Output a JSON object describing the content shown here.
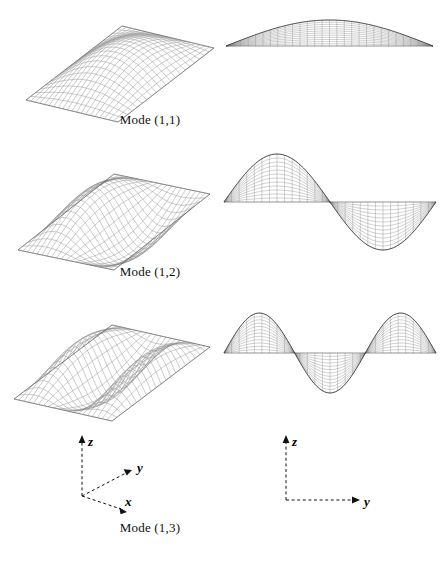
{
  "figure": {
    "background_color": "#ffffff",
    "mesh_color": "#8c8c8c",
    "mesh_dark_color": "#2b2b2b",
    "outline_color": "#555555",
    "width": 443,
    "height": 562
  },
  "modes": [
    {
      "id": "mode-1-1",
      "caption": "Mode (1,1)",
      "m": 1,
      "n": 1,
      "description_3d": "single half-sine bulge, fundamental bending surface",
      "description_2d": "shallow single downward bow band, no interior nodes",
      "nodal_lines": 0,
      "grid_u": 20,
      "grid_v": 20
    },
    {
      "id": "mode-1-2",
      "caption": "Mode (1,2)",
      "m": 1,
      "n": 2,
      "description_3d": "antisymmetric saddle / twisted surface",
      "description_2d": "bowtie: left lobe up, right lobe down, node at mid-span",
      "nodal_lines": 1,
      "grid_u": 20,
      "grid_v": 20
    },
    {
      "id": "mode-1-3",
      "caption": "Mode (1,3)",
      "m": 1,
      "n": 3,
      "description_3d": "three-lobe wave surface with central dome",
      "description_2d": "central dome up with two outer lobes down, two nodes",
      "nodal_lines": 2,
      "grid_u": 20,
      "grid_v": 20
    }
  ],
  "axes_3d": {
    "name": "3d-coordinate-triad",
    "style": "dashed-with-arrowheads",
    "labels": {
      "x": "x",
      "y": "y",
      "z": "z"
    }
  },
  "axes_2d": {
    "name": "2d-coordinate-triad",
    "style": "dashed-with-arrowheads",
    "labels": {
      "y": "y",
      "z": "z"
    }
  },
  "chart_data": {
    "type": "line",
    "xlabel": "y",
    "ylabel": "z",
    "grid": false,
    "legend_position": "none",
    "x": [
      0.0,
      0.05,
      0.1,
      0.15,
      0.2,
      0.25,
      0.3,
      0.35,
      0.4,
      0.45,
      0.5,
      0.55,
      0.6,
      0.65,
      0.7,
      0.75,
      0.8,
      0.85,
      0.9,
      0.95,
      1.0
    ],
    "series": [
      {
        "name": "Mode (1,1) — w = sin(pi*y)",
        "values": [
          0.0,
          0.156,
          0.309,
          0.454,
          0.588,
          0.707,
          0.809,
          0.891,
          0.951,
          0.988,
          1.0,
          0.988,
          0.951,
          0.891,
          0.809,
          0.707,
          0.588,
          0.454,
          0.309,
          0.156,
          0.0
        ]
      },
      {
        "name": "Mode (1,2) — w = sin(2*pi*y)",
        "values": [
          0.0,
          0.309,
          0.588,
          0.809,
          0.951,
          1.0,
          0.951,
          0.809,
          0.588,
          0.309,
          0.0,
          -0.309,
          -0.588,
          -0.809,
          -0.951,
          -1.0,
          -0.951,
          -0.809,
          -0.588,
          -0.309,
          0.0
        ]
      },
      {
        "name": "Mode (1,3) — w = sin(3*pi*y)",
        "values": [
          0.0,
          0.454,
          0.809,
          0.988,
          0.951,
          0.707,
          0.309,
          -0.156,
          -0.588,
          -0.891,
          -1.0,
          -0.891,
          -0.588,
          -0.156,
          0.309,
          0.707,
          0.951,
          0.988,
          0.809,
          0.454,
          0.0
        ]
      }
    ],
    "xlim": [
      0,
      1
    ],
    "ylim": [
      -1,
      1
    ]
  }
}
